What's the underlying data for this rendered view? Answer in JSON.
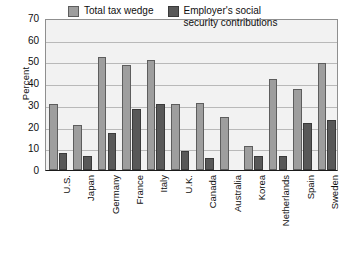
{
  "chart_data": {
    "type": "bar",
    "title": "",
    "subtitle": "",
    "xlabel": "",
    "ylabel": "Percent",
    "ylim": [
      0,
      70
    ],
    "yticks": [
      0,
      10,
      20,
      30,
      40,
      50,
      60,
      70
    ],
    "ytick_labels": [
      "0",
      "10",
      "20",
      "30",
      "40",
      "50",
      "60",
      "70"
    ],
    "grid": true,
    "legend_position": "top-center-inside",
    "categories": [
      "U.S.",
      "Japan",
      "Germany",
      "France",
      "Italy",
      "U.K.",
      "Canada",
      "Australia",
      "Korea",
      "Netherlands",
      "Spain",
      "Sweden"
    ],
    "series": [
      {
        "name": "Total tax wedge",
        "color": "#9e9e9e",
        "values": [
          30.5,
          20.7,
          52.0,
          48.3,
          50.6,
          30.2,
          31.0,
          24.4,
          11.1,
          42.0,
          37.3,
          49.1
        ]
      },
      {
        "name": "Employer's social\nsecurity contributions",
        "color": "#585858",
        "values": [
          7.7,
          6.6,
          16.9,
          27.9,
          30.5,
          8.6,
          5.4,
          null,
          6.3,
          6.4,
          21.7,
          23.2
        ]
      }
    ]
  },
  "legend": [
    {
      "label": "Total tax wedge"
    },
    {
      "label": "Employer's social\nsecurity contributions"
    }
  ]
}
